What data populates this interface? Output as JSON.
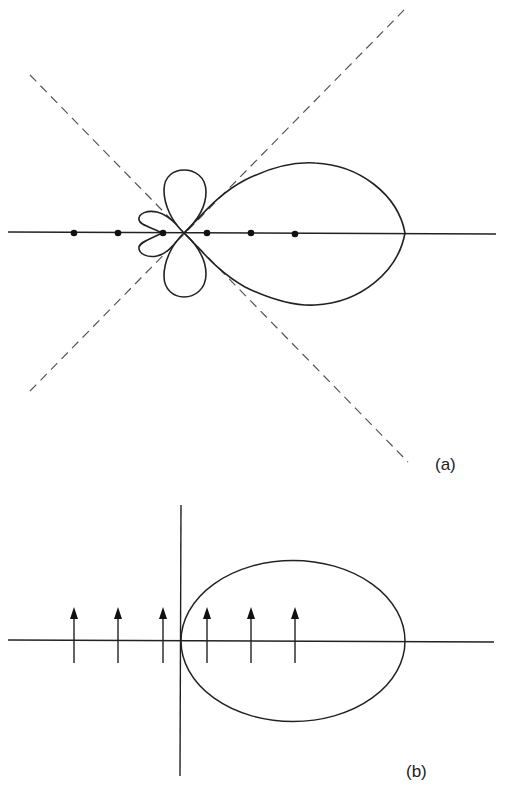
{
  "panels": [
    {
      "id": "a",
      "label": "(a)",
      "description": "Radiation pattern of a linear array with dipole elements: main lobe to the right, small side lobes, dashed asymptote lines",
      "element_marker": "dot",
      "element_count": 6
    },
    {
      "id": "b",
      "label": "(b)",
      "description": "Array of six vertically oriented dipoles (arrows) along an axis with an elliptical pattern tangent to the vertical axis",
      "element_marker": "arrow-up",
      "element_count": 6
    }
  ],
  "colors": {
    "line": "#222222",
    "dashed": "#555555",
    "background": "#ffffff"
  }
}
